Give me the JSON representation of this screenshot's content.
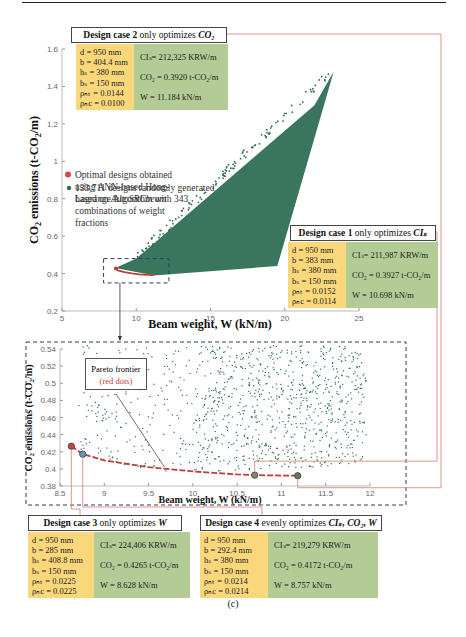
{
  "caption": "(c)",
  "chart_data": [
    {
      "type": "scatter",
      "title": "",
      "xlabel": "Beam weight, W (kN/m)",
      "ylabel": "CO2 emissions (t-CO2/m)",
      "xlim": [
        5,
        25
      ],
      "ylim": [
        0.2,
        1.6
      ],
      "xticks": [
        "5",
        "10",
        "15",
        "20",
        "25"
      ],
      "yticks": [
        "0.2",
        "0.4",
        "0.6",
        "0.8",
        "1",
        "1.2",
        "1.4",
        "1.6"
      ],
      "legend": [
        {
          "label": "133,711 designs randomly generated based on AutoSRCbeam",
          "color": "#2e6f54"
        },
        {
          "label": "Optimal designs obtained using ANN-based Hong-Lagrange Algorithm with 343 combinations of weight fractions",
          "color": "#d24a4a"
        }
      ],
      "legend_placement": "upper-left",
      "random_designs_region": {
        "description": "dense wedge of points",
        "outline": [
          [
            8.6,
            0.43
          ],
          [
            11.2,
            0.39
          ],
          [
            19.5,
            0.44
          ],
          [
            23.3,
            1.48
          ],
          [
            22.0,
            1.3
          ],
          [
            10.0,
            0.48
          ]
        ]
      },
      "optimal_curve": {
        "x": [
          8.63,
          8.76,
          9.2,
          9.7,
          10.2,
          10.7,
          11.18
        ],
        "y": [
          0.4265,
          0.4172,
          0.408,
          0.401,
          0.396,
          0.3927,
          0.392
        ]
      },
      "zoom_box": {
        "x": [
          7.8,
          12.2
        ],
        "y": [
          0.35,
          0.48
        ]
      }
    },
    {
      "type": "scatter",
      "title": "",
      "xlabel": "Beam weight, W (kN/m)",
      "ylabel": "CO2 emissions (t-CO2/m)",
      "xlim": [
        8.5,
        12
      ],
      "ylim": [
        0.38,
        0.54
      ],
      "xticks": [
        "8.5",
        "9",
        "9.5",
        "10",
        "10.5",
        "11",
        "11.5",
        "12"
      ],
      "yticks": [
        "0.38",
        "0.4",
        "0.42",
        "0.44",
        "0.46",
        "0.48",
        "0.5",
        "0.52",
        "0.54"
      ],
      "annotation": {
        "title": "Pareto frontier",
        "subtitle": "(red dots)"
      },
      "pareto_frontier": {
        "x": [
          8.628,
          8.757,
          9.0,
          9.5,
          10.0,
          10.5,
          10.698,
          11.0,
          11.184
        ],
        "y": [
          0.4265,
          0.4172,
          0.41,
          0.402,
          0.397,
          0.3935,
          0.3927,
          0.3922,
          0.392
        ]
      },
      "highlighted_points": [
        {
          "case": "3",
          "x": 8.628,
          "y": 0.4265,
          "color": "#c04848"
        },
        {
          "case": "4",
          "x": 8.757,
          "y": 0.4172,
          "color": "#6b93b8"
        },
        {
          "case": "1",
          "x": 10.698,
          "y": 0.3927,
          "color": "#7a8a6a"
        },
        {
          "case": "2",
          "x": 11.184,
          "y": 0.392,
          "color": "#5f7a66"
        }
      ]
    }
  ],
  "cases": [
    {
      "id": "case2",
      "title_bold": "Design case 2",
      "title_rest": " only optimizes ",
      "title_target": "CO₂",
      "params": [
        "d = 950 mm",
        "b = 404.4 mm",
        "hₛ = 380 mm",
        "bₛ = 150 mm",
        "ρₙₜ = 0.0144",
        "ρₙc = 0.0100"
      ],
      "results": [
        "CIₛ= 212,325 KRW/m",
        "CO₂ = 0.3920 t-CO₂/m",
        "W   = 11.184 kN/m"
      ]
    },
    {
      "id": "case1",
      "title_bold": "Design case 1",
      "title_rest": " only optimizes ",
      "title_target": "CIₛ",
      "params": [
        "d = 950 mm",
        "b = 383 mm",
        "hₛ = 380 mm",
        "bₛ = 150 mm",
        "ρₙₜ = 0.0152",
        "ρₙc = 0.0114"
      ],
      "results": [
        "CIₛ= 211,987 KRW/m",
        "CO₂ = 0.3927 t-CO₂/m",
        "W   = 10.698 kN/m"
      ]
    },
    {
      "id": "case3",
      "title_bold": "Design case 3",
      "title_rest": " only optimizes ",
      "title_target": "W",
      "params": [
        "d = 950 mm",
        "b = 285 mm",
        "hₛ = 408.8 mm",
        "bₛ = 150 mm",
        "ρₙₜ = 0.0225",
        "ρₙc = 0.0225"
      ],
      "results": [
        "CIₛ= 224,406 KRW/m",
        "CO₂ = 0.4265 t-CO₂/m",
        "W   = 8.628  kN/m"
      ]
    },
    {
      "id": "case4",
      "title_bold": "Design case 4",
      "title_rest": " evenly optimizes ",
      "title_target": "CIₛ, CO₂, W",
      "params": [
        "d = 950 mm",
        "b = 292.4 mm",
        "hₛ = 380 mm",
        "bₛ = 150 mm",
        "ρₙₜ = 0.0214",
        "ρₙc = 0.0214"
      ],
      "results": [
        "CIₛ= 219,279 KRW/m",
        "CO₂ = 0.4172 t-CO₂/m",
        "W   = 8.757  kN/m"
      ]
    }
  ],
  "colors": {
    "scatter": "#2e6f54",
    "optimal": "#c03a3a",
    "leader": "#d98a7a",
    "yellow": "#fbd77b",
    "green": "#b3cc96"
  }
}
